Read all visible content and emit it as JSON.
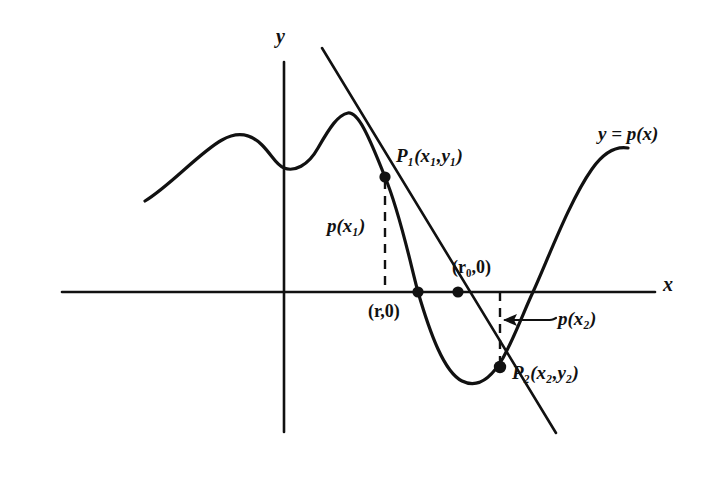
{
  "figure": {
    "type": "secant-method-diagram",
    "axes": {
      "x_label": "x",
      "y_label": "y"
    },
    "curve": {
      "equation_label": "y = p(x)"
    },
    "points": [
      {
        "id": "P1",
        "label_prefix": "P",
        "label_sub": "1",
        "coords": "(x₁,y₁)"
      },
      {
        "id": "P2",
        "label_prefix": "P",
        "label_sub": "2",
        "coords": "(x₂,y₂)"
      }
    ],
    "labels": {
      "p_x1": "p(x₁)",
      "p_x2": "p(x₂)",
      "root_r": "(r,0)",
      "root_r0": "(r₀,0)",
      "p1_full": "P₁(x₁,y₁)",
      "p2_full": "P₂(x₂,y₂)",
      "curve_eq": "y = p(x)",
      "axis_x": "x",
      "axis_y": "y"
    },
    "colors": {
      "ink": "#111111",
      "background": "#ffffff"
    }
  }
}
